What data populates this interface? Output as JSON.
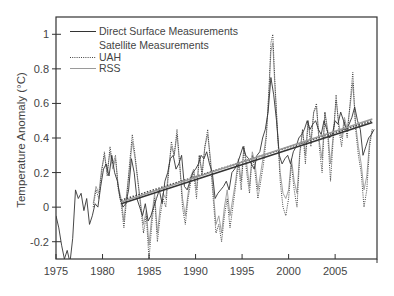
{
  "chart_data": {
    "type": "line",
    "title": "",
    "xlabel": "",
    "ylabel": "Temperature Anomaly (°C)",
    "xlim": [
      1975,
      2009.5
    ],
    "ylim": [
      -0.3,
      1.1
    ],
    "x_ticks": [
      1975,
      1980,
      1985,
      1990,
      1995,
      2000,
      2005
    ],
    "y_ticks": [
      -0.2,
      0,
      0.2,
      0.4,
      0.6,
      0.8,
      1
    ],
    "y_tick_labels": [
      "-0.2",
      "0",
      "0.2",
      "0.4",
      "0.6",
      "0.8",
      "1"
    ],
    "grid": false,
    "legend": {
      "position": "upper-left",
      "entries": [
        {
          "label": "Direct Surface Measurements",
          "style": "solid-dark"
        },
        {
          "label": "Satellite Measurements",
          "style": "heading"
        },
        {
          "label": "UAH",
          "style": "dotted"
        },
        {
          "label": "RSS",
          "style": "solid-light"
        }
      ]
    },
    "series": [
      {
        "name": "Direct Surface Measurements",
        "style": "solid",
        "color": "#333333",
        "x": [
          1975.0,
          1975.3,
          1975.6,
          1975.9,
          1976.2,
          1976.5,
          1976.8,
          1977.1,
          1977.4,
          1977.7,
          1978.0,
          1978.3,
          1978.6,
          1978.9,
          1979.2,
          1979.5,
          1979.8,
          1980.1,
          1980.4,
          1980.7,
          1981.0,
          1981.3,
          1981.6,
          1981.9,
          1982.2,
          1982.5,
          1982.8,
          1983.1,
          1983.4,
          1983.7,
          1984.0,
          1984.3,
          1984.6,
          1984.9,
          1985.2,
          1985.5,
          1985.8,
          1986.1,
          1986.4,
          1986.7,
          1987.0,
          1987.3,
          1987.6,
          1987.9,
          1988.2,
          1988.5,
          1988.8,
          1989.1,
          1989.4,
          1989.7,
          1990.0,
          1990.3,
          1990.6,
          1990.9,
          1991.2,
          1991.5,
          1991.8,
          1992.1,
          1992.4,
          1992.7,
          1993.0,
          1993.3,
          1993.6,
          1993.9,
          1994.2,
          1994.5,
          1994.8,
          1995.1,
          1995.4,
          1995.7,
          1996.0,
          1996.3,
          1996.6,
          1996.9,
          1997.2,
          1997.5,
          1997.8,
          1998.1,
          1998.4,
          1998.7,
          1999.0,
          1999.3,
          1999.6,
          1999.9,
          2000.2,
          2000.5,
          2000.8,
          2001.1,
          2001.4,
          2001.7,
          2002.0,
          2002.3,
          2002.6,
          2002.9,
          2003.2,
          2003.5,
          2003.8,
          2004.1,
          2004.4,
          2004.7,
          2005.0,
          2005.3,
          2005.6,
          2005.9,
          2006.2,
          2006.5,
          2006.8,
          2007.1,
          2007.4,
          2007.7,
          2008.0,
          2008.3,
          2008.6,
          2008.9,
          2009.2
        ],
        "values": [
          -0.05,
          -0.12,
          -0.22,
          -0.3,
          -0.25,
          -0.32,
          -0.18,
          0.1,
          0.05,
          0.08,
          -0.02,
          0.05,
          -0.1,
          -0.05,
          0.02,
          0.0,
          0.12,
          0.22,
          0.25,
          0.18,
          0.3,
          0.2,
          0.15,
          0.05,
          0.0,
          0.02,
          0.1,
          0.28,
          0.2,
          0.05,
          0.0,
          -0.05,
          0.02,
          -0.08,
          -0.05,
          0.0,
          0.05,
          0.1,
          0.02,
          0.15,
          0.2,
          0.28,
          0.3,
          0.22,
          0.25,
          0.3,
          0.12,
          0.1,
          0.15,
          0.2,
          0.22,
          0.25,
          0.3,
          0.28,
          0.32,
          0.25,
          0.2,
          0.05,
          0.08,
          0.1,
          0.12,
          0.15,
          0.1,
          0.2,
          0.22,
          0.25,
          0.3,
          0.35,
          0.3,
          0.28,
          0.25,
          0.22,
          0.3,
          0.32,
          0.4,
          0.45,
          0.55,
          0.75,
          0.65,
          0.5,
          0.3,
          0.25,
          0.28,
          0.3,
          0.25,
          0.32,
          0.35,
          0.4,
          0.42,
          0.45,
          0.5,
          0.45,
          0.48,
          0.5,
          0.45,
          0.42,
          0.5,
          0.45,
          0.4,
          0.42,
          0.5,
          0.48,
          0.55,
          0.5,
          0.45,
          0.48,
          0.52,
          0.58,
          0.5,
          0.45,
          0.3,
          0.35,
          0.4,
          0.42,
          0.45
        ]
      },
      {
        "name": "UAH",
        "style": "dotted",
        "color": "#444444",
        "x": [
          1979.0,
          1979.3,
          1979.6,
          1979.9,
          1980.2,
          1980.5,
          1980.8,
          1981.1,
          1981.4,
          1981.7,
          1982.0,
          1982.3,
          1982.6,
          1982.9,
          1983.2,
          1983.5,
          1983.8,
          1984.1,
          1984.4,
          1984.7,
          1985.0,
          1985.3,
          1985.6,
          1985.9,
          1986.2,
          1986.5,
          1986.8,
          1987.1,
          1987.4,
          1987.7,
          1988.0,
          1988.3,
          1988.6,
          1988.9,
          1989.2,
          1989.5,
          1989.8,
          1990.1,
          1990.4,
          1990.7,
          1991.0,
          1991.3,
          1991.6,
          1991.9,
          1992.2,
          1992.5,
          1992.8,
          1993.1,
          1993.4,
          1993.7,
          1994.0,
          1994.3,
          1994.6,
          1994.9,
          1995.2,
          1995.5,
          1995.8,
          1996.1,
          1996.4,
          1996.7,
          1997.0,
          1997.3,
          1997.6,
          1997.9,
          1998.1,
          1998.3,
          1998.5,
          1998.8,
          1999.1,
          1999.4,
          1999.7,
          2000.0,
          2000.3,
          2000.6,
          2000.9,
          2001.2,
          2001.5,
          2001.8,
          2002.1,
          2002.4,
          2002.7,
          2003.0,
          2003.3,
          2003.6,
          2003.9,
          2004.2,
          2004.5,
          2004.8,
          2005.1,
          2005.4,
          2005.7,
          2006.0,
          2006.3,
          2006.6,
          2006.9,
          2007.2,
          2007.5,
          2007.8,
          2008.1,
          2008.4,
          2008.7,
          2009.0
        ],
        "values": [
          0.0,
          0.1,
          0.05,
          0.2,
          0.32,
          0.18,
          0.35,
          0.25,
          0.3,
          0.1,
          0.02,
          -0.12,
          0.05,
          0.25,
          0.42,
          0.3,
          0.15,
          0.0,
          -0.15,
          -0.05,
          -0.3,
          -0.1,
          0.05,
          -0.2,
          -0.05,
          0.05,
          0.0,
          0.2,
          0.38,
          0.3,
          0.45,
          0.25,
          0.0,
          -0.1,
          0.05,
          0.15,
          0.2,
          0.05,
          0.3,
          0.18,
          0.35,
          0.45,
          0.25,
          0.05,
          -0.15,
          -0.1,
          -0.2,
          -0.05,
          0.05,
          -0.12,
          0.0,
          0.12,
          0.25,
          0.1,
          0.35,
          0.2,
          0.08,
          0.3,
          0.2,
          0.05,
          0.15,
          0.25,
          0.4,
          0.7,
          0.95,
          1.0,
          0.75,
          0.45,
          0.15,
          0.0,
          -0.05,
          0.05,
          0.25,
          0.1,
          0.0,
          0.3,
          0.45,
          0.25,
          0.5,
          0.35,
          0.55,
          0.6,
          0.35,
          0.2,
          0.55,
          0.42,
          0.15,
          0.4,
          0.65,
          0.45,
          0.35,
          0.5,
          0.4,
          0.6,
          0.78,
          0.45,
          0.3,
          0.2,
          0.0,
          0.1,
          0.35,
          0.45
        ]
      },
      {
        "name": "RSS",
        "style": "solid-light",
        "color": "#999999",
        "x": [
          1979.0,
          1979.3,
          1979.6,
          1979.9,
          1980.2,
          1980.5,
          1980.8,
          1981.1,
          1981.4,
          1981.7,
          1982.0,
          1982.3,
          1982.6,
          1982.9,
          1983.2,
          1983.5,
          1983.8,
          1984.1,
          1984.4,
          1984.7,
          1985.0,
          1985.3,
          1985.6,
          1985.9,
          1986.2,
          1986.5,
          1986.8,
          1987.1,
          1987.4,
          1987.7,
          1988.0,
          1988.3,
          1988.6,
          1988.9,
          1989.2,
          1989.5,
          1989.8,
          1990.1,
          1990.4,
          1990.7,
          1991.0,
          1991.3,
          1991.6,
          1991.9,
          1992.2,
          1992.5,
          1992.8,
          1993.1,
          1993.4,
          1993.7,
          1994.0,
          1994.3,
          1994.6,
          1994.9,
          1995.2,
          1995.5,
          1995.8,
          1996.1,
          1996.4,
          1996.7,
          1997.0,
          1997.3,
          1997.6,
          1997.9,
          1998.1,
          1998.3,
          1998.5,
          1998.8,
          1999.1,
          1999.4,
          1999.7,
          2000.0,
          2000.3,
          2000.6,
          2000.9,
          2001.2,
          2001.5,
          2001.8,
          2002.1,
          2002.4,
          2002.7,
          2003.0,
          2003.3,
          2003.6,
          2003.9,
          2004.2,
          2004.5,
          2004.8,
          2005.1,
          2005.4,
          2005.7,
          2006.0,
          2006.3,
          2006.6,
          2006.9,
          2007.2,
          2007.5,
          2007.8,
          2008.1,
          2008.4,
          2008.7,
          2009.0
        ],
        "values": [
          0.02,
          0.12,
          0.08,
          0.22,
          0.3,
          0.2,
          0.32,
          0.22,
          0.28,
          0.12,
          0.05,
          -0.08,
          0.08,
          0.22,
          0.38,
          0.28,
          0.15,
          0.02,
          -0.1,
          -0.02,
          -0.22,
          -0.05,
          0.08,
          -0.15,
          0.0,
          0.08,
          0.05,
          0.22,
          0.35,
          0.3,
          0.42,
          0.25,
          0.05,
          -0.05,
          0.08,
          0.18,
          0.22,
          0.1,
          0.3,
          0.2,
          0.35,
          0.42,
          0.28,
          0.1,
          -0.1,
          -0.05,
          -0.15,
          0.0,
          0.1,
          -0.05,
          0.05,
          0.15,
          0.28,
          0.15,
          0.35,
          0.25,
          0.12,
          0.32,
          0.25,
          0.1,
          0.2,
          0.3,
          0.42,
          0.68,
          0.9,
          0.95,
          0.72,
          0.45,
          0.2,
          0.08,
          0.05,
          0.1,
          0.28,
          0.15,
          0.08,
          0.32,
          0.45,
          0.3,
          0.5,
          0.38,
          0.55,
          0.58,
          0.38,
          0.28,
          0.55,
          0.45,
          0.25,
          0.42,
          0.62,
          0.48,
          0.4,
          0.52,
          0.45,
          0.58,
          0.72,
          0.48,
          0.35,
          0.25,
          0.1,
          0.18,
          0.38,
          0.45
        ]
      }
    ],
    "trend_lines": [
      {
        "name": "Surface trend",
        "style": "solid",
        "x": [
          1982.0,
          2009.0
        ],
        "values": [
          0.02,
          0.49
        ]
      },
      {
        "name": "UAH trend",
        "style": "dotted",
        "x": [
          1982.0,
          2009.0
        ],
        "values": [
          0.04,
          0.5
        ]
      },
      {
        "name": "RSS trend",
        "style": "solid-light",
        "x": [
          1982.0,
          2009.0
        ],
        "values": [
          0.03,
          0.51
        ]
      }
    ]
  },
  "layout": {
    "plot": {
      "left": 56,
      "top": 17,
      "right": 377,
      "bottom": 259
    },
    "colors": {
      "axis": "#333333",
      "surface": "#333333",
      "uah": "#444444",
      "rss": "#9a9a9a",
      "text": "#444444"
    }
  }
}
